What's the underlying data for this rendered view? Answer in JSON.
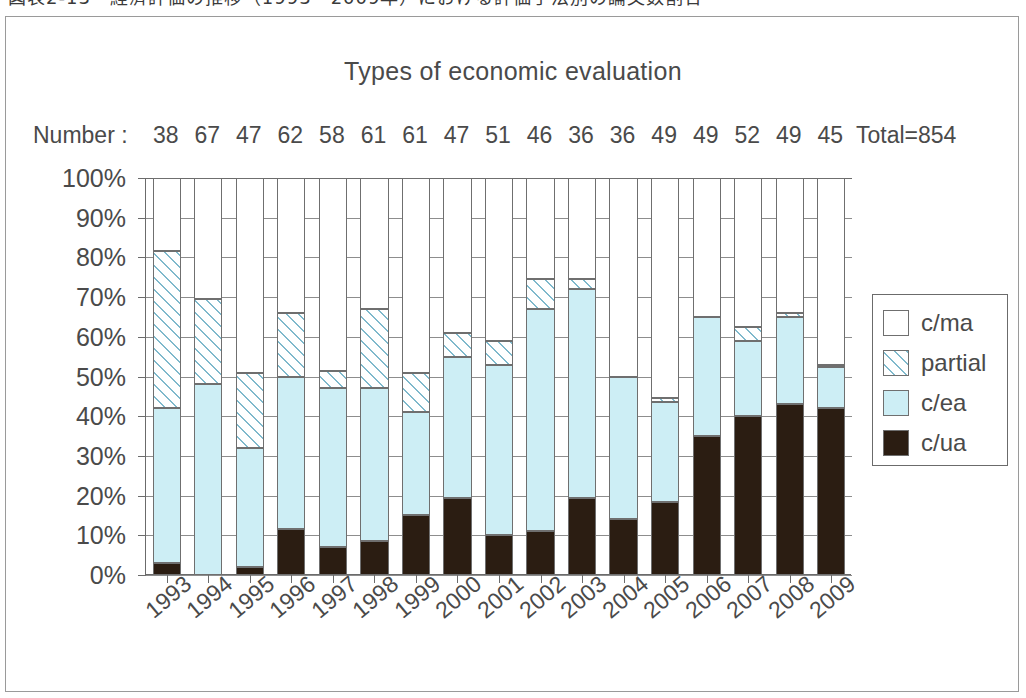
{
  "caption": {
    "text": "図表2-13　経済評価の推移（1993～2009年）における評価手法別の論文数割合"
  },
  "chart_data": {
    "type": "bar",
    "subtype": "stacked-percent",
    "title": "Types of economic evaluation",
    "xlabel": "",
    "ylabel": "",
    "ylim": [
      0,
      100
    ],
    "ytick_labels": [
      "100%",
      "90%",
      "80%",
      "70%",
      "60%",
      "50%",
      "40%",
      "30%",
      "20%",
      "10%",
      "0%"
    ],
    "ytick_values": [
      100,
      90,
      80,
      70,
      60,
      50,
      40,
      30,
      20,
      10,
      0
    ],
    "grid": true,
    "legend_position": "right",
    "categories": [
      "1993",
      "1994",
      "1995",
      "1996",
      "1997",
      "1998",
      "1999",
      "2000",
      "2001",
      "2002",
      "2003",
      "2004",
      "2005",
      "2006",
      "2007",
      "2008",
      "2009"
    ],
    "counts_label": "Number :",
    "counts": [
      38,
      67,
      47,
      62,
      58,
      61,
      61,
      47,
      51,
      46,
      36,
      36,
      49,
      49,
      52,
      49,
      45
    ],
    "total_label": "Total=854",
    "total": 854,
    "series": [
      {
        "name": "c/ua",
        "color": "#2b1d12",
        "pattern": "solid",
        "values": [
          3,
          0,
          2,
          11.5,
          7,
          8.5,
          15,
          19.5,
          10,
          11,
          19.5,
          14,
          18.5,
          35,
          40,
          43,
          42
        ]
      },
      {
        "name": "c/ea",
        "color": "#cdeef5",
        "pattern": "solid",
        "values": [
          39,
          48,
          30,
          38.5,
          40,
          38.5,
          26,
          35.5,
          43,
          56,
          52.5,
          36,
          25,
          30,
          19,
          22,
          10.5
        ]
      },
      {
        "name": "partial",
        "color": "#ffffff",
        "pattern": "diagonal-hatch",
        "values": [
          39.5,
          21.5,
          19,
          16,
          4.5,
          20,
          10,
          6,
          6,
          7.5,
          2.5,
          0,
          1,
          0,
          3.5,
          1,
          0.5
        ]
      },
      {
        "name": "c/ma",
        "color": "#ffffff",
        "pattern": "solid",
        "values": [
          18.5,
          30.5,
          49,
          34,
          48.5,
          33,
          49,
          39,
          41,
          25.5,
          25.5,
          50,
          55.5,
          35,
          37.5,
          34,
          47
        ]
      }
    ],
    "legend_entries": [
      {
        "label": "c/ma",
        "swatch": "white"
      },
      {
        "label": "partial",
        "swatch": "hatch"
      },
      {
        "label": "c/ea",
        "swatch": "lightblue"
      },
      {
        "label": "c/ua",
        "swatch": "black"
      }
    ],
    "colors": {
      "c_ma": "#ffffff",
      "partial_hatch": "#7fb9cc",
      "c_ea": "#cdeef5",
      "c_ua": "#2b1d12",
      "axis": "#6b6b6b",
      "grid": "#8d8d8d",
      "text": "#4a4a4a"
    }
  }
}
